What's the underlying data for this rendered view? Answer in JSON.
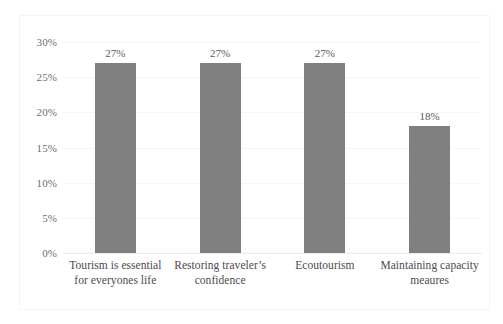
{
  "figure": {
    "top_clipped_text": "·  ·            ·                    ·",
    "frame_color": "#f4f4f5",
    "background": "#ffffff"
  },
  "axis": {
    "y_ticks": [
      "0%",
      "5%",
      "10%",
      "15%",
      "20%",
      "25%",
      "30%"
    ],
    "y_tick_values": [
      0,
      5,
      10,
      15,
      20,
      25,
      30
    ],
    "label_color": "#6e6e72"
  },
  "bars": [
    {
      "label_line1": "Tourism is essential",
      "label_line2": "for everyones life",
      "value": 27,
      "value_label": "27%"
    },
    {
      "label_line1": "Restoring traveler’s",
      "label_line2": "confidence",
      "value": 27,
      "value_label": "27%"
    },
    {
      "label_line1": "Ecoutourism",
      "label_line2": "",
      "value": 27,
      "value_label": "27%"
    },
    {
      "label_line1": "Maintaining capacity",
      "label_line2": "meaures",
      "value": 18,
      "value_label": "18%"
    }
  ],
  "colors": {
    "bar_fill": "#808080",
    "gridline": "#f6f6f6",
    "axis_line": "#e9e9ea",
    "value_text": "#58585c",
    "category_text": "#4a4a4e"
  },
  "chart_data": {
    "type": "bar",
    "title": "",
    "subtitle": "",
    "xlabel": "",
    "ylabel": "",
    "categories": [
      "Tourism is essential for everyones life",
      "Restoring traveler’s confidence",
      "Ecoutourism",
      "Maintaining capacity meaures"
    ],
    "values": [
      27,
      27,
      27,
      18
    ],
    "data_labels": [
      "27%",
      "27%",
      "27%",
      "18%"
    ],
    "ylim": [
      0,
      30
    ],
    "y_tick_step": 5,
    "y_tick_labels": [
      "0%",
      "5%",
      "10%",
      "15%",
      "20%",
      "25%",
      "30%"
    ],
    "y_unit": "%",
    "grid": "horizontal-faint",
    "legend": "none",
    "bar_color": "#808080",
    "orientation": "vertical"
  }
}
